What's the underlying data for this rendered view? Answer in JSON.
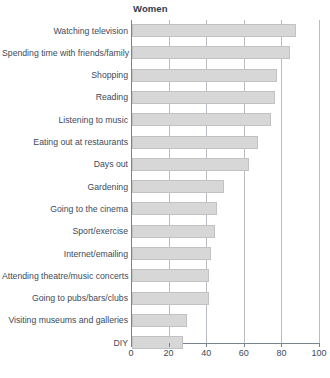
{
  "chart_data": {
    "type": "bar",
    "title": "Women",
    "orientation": "horizontal",
    "xlabel": "",
    "ylabel": "",
    "xlim": [
      0,
      100
    ],
    "xticks": [
      0,
      20,
      40,
      60,
      80,
      100
    ],
    "xtick_labels": [
      "0",
      "20",
      "40",
      "60",
      "80",
      "100"
    ],
    "grid": true,
    "legend": false,
    "bar_color": "#d7d7d7",
    "bar_border_color": "#c2c2c2",
    "axis_color": "#7a8491",
    "text_color": "#3c4b5c",
    "categories": [
      "Watching television",
      "Spending time with friends/family",
      "Shopping",
      "Reading",
      "Listening to music",
      "Eating out at restaurants",
      "Days out",
      "Gardening",
      "Going to the cinema",
      "Sport/exercise",
      "Internet/emailing",
      "Attending theatre/music concerts",
      "Going to pubs/bars/clubs",
      "Visiting museums and galleries",
      "DIY"
    ],
    "values": [
      87,
      84,
      77,
      76,
      74,
      67,
      62,
      49,
      45,
      44,
      42,
      41,
      41,
      29,
      27
    ]
  }
}
